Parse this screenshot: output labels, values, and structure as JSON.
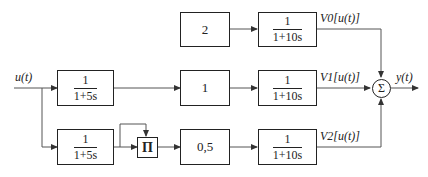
{
  "diagram": {
    "type": "block-diagram",
    "input": {
      "label": "u(t)"
    },
    "output": {
      "label": "y(t)"
    },
    "summer": {
      "symbol": "Σ"
    },
    "multiplier": {
      "symbol": "Π"
    },
    "branches": [
      {
        "id": "branch0",
        "gain": "2",
        "filter": {
          "num": "1",
          "den": "1+10s"
        },
        "output_label": "V0[u(t)]"
      },
      {
        "id": "branch1",
        "prefilter": {
          "num": "1",
          "den": "1+5s"
        },
        "gain": "1",
        "filter": {
          "num": "1",
          "den": "1+10s"
        },
        "output_label": "V1[u(t)]"
      },
      {
        "id": "branch2",
        "prefilter": {
          "num": "1",
          "den": "1+5s"
        },
        "gain": "0,5",
        "filter": {
          "num": "1",
          "den": "1+10s"
        },
        "output_label": "V2[u(t)]"
      }
    ]
  }
}
